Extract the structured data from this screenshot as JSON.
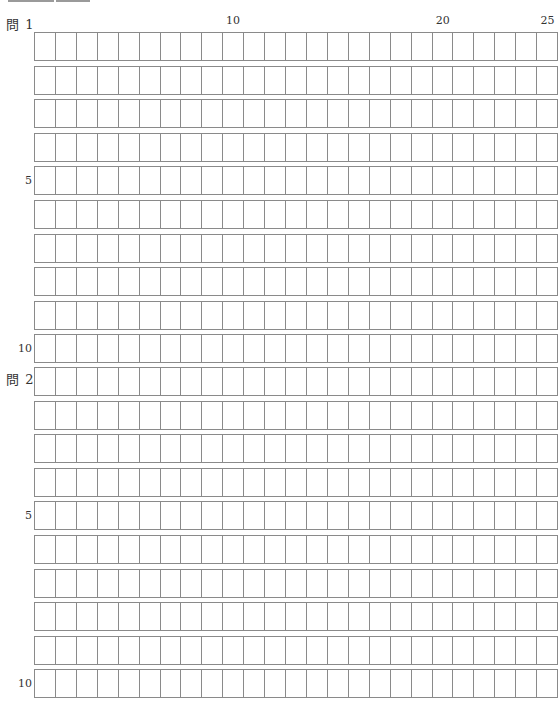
{
  "header": {
    "bars": [
      {
        "left": 8,
        "width": 46
      },
      {
        "left": 56,
        "width": 34
      }
    ]
  },
  "column_numbers": [
    {
      "label": "10",
      "column": 10
    },
    {
      "label": "20",
      "column": 20
    },
    {
      "label": "25",
      "column": 25
    }
  ],
  "sheet": {
    "columns": 25,
    "rows_per_question": 10,
    "questions": [
      {
        "label": "問 1",
        "grid_top": 32,
        "row_markers": [
          {
            "label": "5",
            "row": 5
          },
          {
            "label": "10",
            "row": 10
          }
        ]
      },
      {
        "label": "問 2",
        "grid_top": 367,
        "row_markers": [
          {
            "label": "5",
            "row": 5
          },
          {
            "label": "10",
            "row": 10
          }
        ]
      }
    ]
  },
  "colors": {
    "grid_line": "#8a8a8a",
    "text": "#333333",
    "header_bar": "#9a9a9a"
  }
}
